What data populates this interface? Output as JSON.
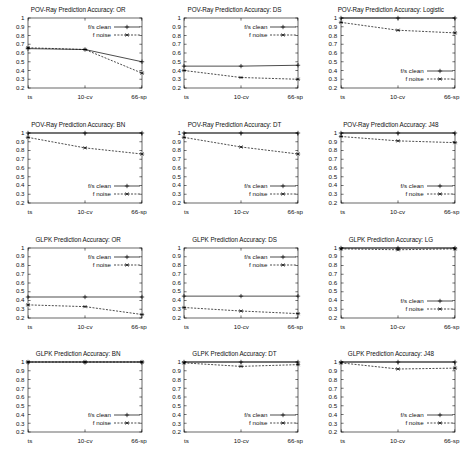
{
  "figure": {
    "y_axis": {
      "min": 0.2,
      "max": 1.0,
      "ticks": [
        "0.2",
        "0.3",
        "0.4",
        "0.5",
        "0.6",
        "0.7",
        "0.8",
        "0.9",
        "1"
      ],
      "tick_values": [
        0.2,
        0.3,
        0.4,
        0.5,
        0.6,
        0.7,
        0.8,
        0.9,
        1.0
      ]
    },
    "x_axis": {
      "ticks": [
        "ts",
        "10-cv",
        "66-sp"
      ]
    },
    "legend": {
      "clean_label": "f/s clean",
      "noise_label": "f noise"
    },
    "colors": {
      "line": "#000000",
      "axis": "#000000",
      "background": "#ffffff"
    }
  },
  "chart_data": [
    {
      "type": "line",
      "title": "POV-Ray Prediction Accuracy: OR",
      "categories": [
        "ts",
        "10-cv",
        "66-sp"
      ],
      "series": [
        {
          "name": "f/s clean",
          "values": [
            0.65,
            0.64,
            0.5
          ],
          "style": "solid",
          "marker": "plus"
        },
        {
          "name": "f noise",
          "values": [
            0.66,
            0.64,
            0.37
          ],
          "style": "dashed",
          "marker": "star"
        }
      ],
      "xlabel": "",
      "ylabel": "",
      "ylim": [
        0.2,
        1.0
      ],
      "grid": false,
      "legend_position": "top-right"
    },
    {
      "type": "line",
      "title": "POV-Ray Prediction Accuracy: DS",
      "categories": [
        "ts",
        "10-cv",
        "66-sp"
      ],
      "series": [
        {
          "name": "f/s clean",
          "values": [
            0.45,
            0.45,
            0.46
          ],
          "style": "solid",
          "marker": "plus"
        },
        {
          "name": "f noise",
          "values": [
            0.4,
            0.32,
            0.3
          ],
          "style": "dashed",
          "marker": "star"
        }
      ],
      "xlabel": "",
      "ylabel": "",
      "ylim": [
        0.2,
        1.0
      ],
      "grid": false,
      "legend_position": "top-right"
    },
    {
      "type": "line",
      "title": "POV-Ray Prediction Accuracy: Logistic",
      "categories": [
        "ts",
        "10-cv",
        "66-sp"
      ],
      "series": [
        {
          "name": "f/s clean",
          "values": [
            1.0,
            1.0,
            1.0
          ],
          "style": "solid",
          "marker": "plus"
        },
        {
          "name": "f noise",
          "values": [
            0.95,
            0.86,
            0.83
          ],
          "style": "dashed",
          "marker": "star"
        }
      ],
      "xlabel": "",
      "ylabel": "",
      "ylim": [
        0.2,
        1.0
      ],
      "grid": false,
      "legend_position": "bottom-right"
    },
    {
      "type": "line",
      "title": "POV-Ray Prediction Accuracy: BN",
      "categories": [
        "ts",
        "10-cv",
        "66-sp"
      ],
      "series": [
        {
          "name": "f/s clean",
          "values": [
            1.0,
            1.0,
            1.0
          ],
          "style": "solid",
          "marker": "plus"
        },
        {
          "name": "f noise",
          "values": [
            0.95,
            0.83,
            0.76
          ],
          "style": "dashed",
          "marker": "star"
        }
      ],
      "xlabel": "",
      "ylabel": "",
      "ylim": [
        0.2,
        1.0
      ],
      "grid": false,
      "legend_position": "bottom-right"
    },
    {
      "type": "line",
      "title": "POV-Ray Prediction Accuracy: DT",
      "categories": [
        "ts",
        "10-cv",
        "66-sp"
      ],
      "series": [
        {
          "name": "f/s clean",
          "values": [
            1.0,
            1.0,
            1.0
          ],
          "style": "solid",
          "marker": "plus"
        },
        {
          "name": "f noise",
          "values": [
            0.95,
            0.84,
            0.76
          ],
          "style": "dashed",
          "marker": "star"
        }
      ],
      "xlabel": "",
      "ylabel": "",
      "ylim": [
        0.2,
        1.0
      ],
      "grid": false,
      "legend_position": "bottom-right"
    },
    {
      "type": "line",
      "title": "POV-Ray Prediction Accuracy: J48",
      "categories": [
        "ts",
        "10-cv",
        "66-sp"
      ],
      "series": [
        {
          "name": "f/s clean",
          "values": [
            1.0,
            1.0,
            1.0
          ],
          "style": "solid",
          "marker": "plus"
        },
        {
          "name": "f noise",
          "values": [
            0.96,
            0.91,
            0.89
          ],
          "style": "dashed",
          "marker": "star"
        }
      ],
      "xlabel": "",
      "ylabel": "",
      "ylim": [
        0.2,
        1.0
      ],
      "grid": false,
      "legend_position": "bottom-right"
    },
    {
      "type": "line",
      "title": "GLPK Prediction Accuracy: OR",
      "categories": [
        "ts",
        "10-cv",
        "66-sp"
      ],
      "series": [
        {
          "name": "f/s clean",
          "values": [
            0.44,
            0.44,
            0.44
          ],
          "style": "solid",
          "marker": "plus"
        },
        {
          "name": "f noise",
          "values": [
            0.35,
            0.33,
            0.24
          ],
          "style": "dashed",
          "marker": "star"
        }
      ],
      "xlabel": "",
      "ylabel": "",
      "ylim": [
        0.2,
        1.0
      ],
      "grid": false,
      "legend_position": "top-right"
    },
    {
      "type": "line",
      "title": "GLPK Prediction Accuracy: DS",
      "categories": [
        "ts",
        "10-cv",
        "66-sp"
      ],
      "series": [
        {
          "name": "f/s clean",
          "values": [
            0.45,
            0.45,
            0.45
          ],
          "style": "solid",
          "marker": "plus"
        },
        {
          "name": "f noise",
          "values": [
            0.32,
            0.28,
            0.25
          ],
          "style": "dashed",
          "marker": "star"
        }
      ],
      "xlabel": "",
      "ylabel": "",
      "ylim": [
        0.2,
        1.0
      ],
      "grid": false,
      "legend_position": "top-right"
    },
    {
      "type": "line",
      "title": "GLPK Prediction Accuracy: LG",
      "categories": [
        "ts",
        "10-cv",
        "66-sp"
      ],
      "series": [
        {
          "name": "f/s clean",
          "values": [
            1.0,
            1.0,
            1.0
          ],
          "style": "solid",
          "marker": "plus"
        },
        {
          "name": "f noise",
          "values": [
            0.99,
            0.98,
            0.99
          ],
          "style": "dashed",
          "marker": "star"
        }
      ],
      "xlabel": "",
      "ylabel": "",
      "ylim": [
        0.2,
        1.0
      ],
      "grid": false,
      "legend_position": "bottom-right"
    },
    {
      "type": "line",
      "title": "GLPK Prediction Accuracy: BN",
      "categories": [
        "ts",
        "10-cv",
        "66-sp"
      ],
      "series": [
        {
          "name": "f/s clean",
          "values": [
            1.0,
            1.0,
            1.0
          ],
          "style": "solid",
          "marker": "plus"
        },
        {
          "name": "f noise",
          "values": [
            1.0,
            1.0,
            1.0
          ],
          "style": "dashed",
          "marker": "star"
        }
      ],
      "xlabel": "",
      "ylabel": "",
      "ylim": [
        0.2,
        1.0
      ],
      "grid": false,
      "legend_position": "bottom-right"
    },
    {
      "type": "line",
      "title": "GLPK Prediction Accuracy: DT",
      "categories": [
        "ts",
        "10-cv",
        "66-sp"
      ],
      "series": [
        {
          "name": "f/s clean",
          "values": [
            1.0,
            1.0,
            1.0
          ],
          "style": "solid",
          "marker": "plus"
        },
        {
          "name": "f noise",
          "values": [
            0.99,
            0.95,
            0.97
          ],
          "style": "dashed",
          "marker": "star"
        }
      ],
      "xlabel": "",
      "ylabel": "",
      "ylim": [
        0.2,
        1.0
      ],
      "grid": false,
      "legend_position": "bottom-right"
    },
    {
      "type": "line",
      "title": "GLPK Prediction Accuracy: J48",
      "categories": [
        "ts",
        "10-cv",
        "66-sp"
      ],
      "series": [
        {
          "name": "f/s clean",
          "values": [
            1.0,
            1.0,
            1.0
          ],
          "style": "solid",
          "marker": "plus"
        },
        {
          "name": "f noise",
          "values": [
            0.99,
            0.92,
            0.93
          ],
          "style": "dashed",
          "marker": "star"
        }
      ],
      "xlabel": "",
      "ylabel": "",
      "ylim": [
        0.2,
        1.0
      ],
      "grid": false,
      "legend_position": "bottom-right"
    }
  ]
}
